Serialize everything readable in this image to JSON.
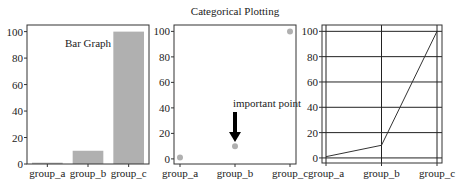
{
  "figure": {
    "suptitle": "Categorical Plotting"
  },
  "chart_data": [
    {
      "type": "bar",
      "title": "",
      "annotation": "Bar Graph",
      "categories": [
        "group_a",
        "group_b",
        "group_c"
      ],
      "values": [
        1,
        10,
        100
      ],
      "xlabel": "",
      "ylabel": "",
      "ylim": [
        0,
        105
      ],
      "yticks": [
        0,
        20,
        40,
        60,
        80,
        100
      ],
      "grid": false,
      "bar_color": "#b0b0b0"
    },
    {
      "type": "scatter",
      "title": "Categorical Plotting",
      "categories": [
        "group_a",
        "group_b",
        "group_c"
      ],
      "values": [
        1,
        10,
        100
      ],
      "annotation": {
        "text": "important point",
        "target": "group_b",
        "arrow": true
      },
      "ylim": [
        -4,
        105
      ],
      "yticks": [
        0,
        20,
        40,
        60,
        80,
        100
      ],
      "grid": false,
      "marker_color": "#b0b0b0"
    },
    {
      "type": "line",
      "title": "",
      "categories": [
        "group_a",
        "group_b",
        "group_c"
      ],
      "values": [
        1,
        10,
        100
      ],
      "ylim": [
        -4,
        105
      ],
      "yticks": [
        0,
        20,
        40,
        60,
        80,
        100
      ],
      "grid": true,
      "line_color": "#333333"
    }
  ]
}
